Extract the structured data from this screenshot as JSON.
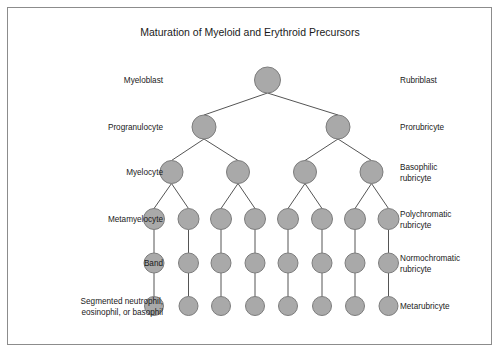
{
  "figure": {
    "title": "Maturation of Myeloid and Erythroid Precursors",
    "frame_color": "#8c8c8c",
    "background_color": "#ffffff",
    "cell_fill_color": "#a9a9a9",
    "cell_stroke_color": "#7d7d7d",
    "connector_color": "#555555",
    "text_color": "#1a1a1a"
  },
  "rows": [
    {
      "id": "row-blast",
      "y": 80,
      "radius": 13,
      "count": 1,
      "x_positions": [
        267.5
      ],
      "left_label": [
        "Myeloblast"
      ],
      "right_label": [
        "Rubriblast"
      ]
    },
    {
      "id": "row-progranulocyte",
      "y": 127,
      "radius": 12,
      "count": 2,
      "x_positions": [
        204,
        338
      ],
      "left_label": [
        "Progranulocyte"
      ],
      "right_label": [
        "Prorubricyte"
      ]
    },
    {
      "id": "row-myelocyte",
      "y": 172,
      "radius": 11.5,
      "count": 4,
      "x_positions": [
        171.5,
        238,
        305,
        371.5
      ],
      "left_label": [
        "Myelocyte"
      ],
      "right_label": [
        "Basophilic",
        "rubricyte"
      ]
    },
    {
      "id": "row-metamyelocyte",
      "y": 219,
      "radius": 10.5,
      "count": 8,
      "x_positions": [
        154,
        188.5,
        221,
        255,
        288,
        322,
        355,
        388.5
      ],
      "left_label": [
        "Metamyelocyte"
      ],
      "right_label": [
        "Polychromatic",
        "rubricyte"
      ]
    },
    {
      "id": "row-band",
      "y": 263,
      "radius": 10,
      "count": 8,
      "x_positions": [
        154,
        188.5,
        221,
        255,
        288,
        322,
        355,
        388.5
      ],
      "left_label": [
        "Band"
      ],
      "right_label": [
        "Normochromatic",
        "rubricyte"
      ]
    },
    {
      "id": "row-segmented",
      "y": 306,
      "radius": 9.5,
      "count": 8,
      "x_positions": [
        154,
        188.5,
        221,
        255,
        288,
        322,
        355,
        388.5
      ],
      "left_label": [
        "Segmented neutrophil,",
        "eosinophil, or basophil"
      ],
      "right_label": [
        "Metarubricyte"
      ]
    }
  ],
  "layout": {
    "left_label_x": 163,
    "right_label_x": 400,
    "title_x": 250,
    "title_y": 36,
    "line_height": 11
  },
  "edges": [
    {
      "from_row": 0,
      "from_index": 0,
      "to_row": 1,
      "to_index": 0
    },
    {
      "from_row": 0,
      "from_index": 0,
      "to_row": 1,
      "to_index": 1
    },
    {
      "from_row": 1,
      "from_index": 0,
      "to_row": 2,
      "to_index": 0
    },
    {
      "from_row": 1,
      "from_index": 0,
      "to_row": 2,
      "to_index": 1
    },
    {
      "from_row": 1,
      "from_index": 1,
      "to_row": 2,
      "to_index": 2
    },
    {
      "from_row": 1,
      "from_index": 1,
      "to_row": 2,
      "to_index": 3
    },
    {
      "from_row": 2,
      "from_index": 0,
      "to_row": 3,
      "to_index": 0
    },
    {
      "from_row": 2,
      "from_index": 0,
      "to_row": 3,
      "to_index": 1
    },
    {
      "from_row": 2,
      "from_index": 1,
      "to_row": 3,
      "to_index": 2
    },
    {
      "from_row": 2,
      "from_index": 1,
      "to_row": 3,
      "to_index": 3
    },
    {
      "from_row": 2,
      "from_index": 2,
      "to_row": 3,
      "to_index": 4
    },
    {
      "from_row": 2,
      "from_index": 2,
      "to_row": 3,
      "to_index": 5
    },
    {
      "from_row": 2,
      "from_index": 3,
      "to_row": 3,
      "to_index": 6
    },
    {
      "from_row": 2,
      "from_index": 3,
      "to_row": 3,
      "to_index": 7
    },
    {
      "from_row": 3,
      "from_index": 0,
      "to_row": 4,
      "to_index": 0
    },
    {
      "from_row": 3,
      "from_index": 1,
      "to_row": 4,
      "to_index": 1
    },
    {
      "from_row": 3,
      "from_index": 2,
      "to_row": 4,
      "to_index": 2
    },
    {
      "from_row": 3,
      "from_index": 3,
      "to_row": 4,
      "to_index": 3
    },
    {
      "from_row": 3,
      "from_index": 4,
      "to_row": 4,
      "to_index": 4
    },
    {
      "from_row": 3,
      "from_index": 5,
      "to_row": 4,
      "to_index": 5
    },
    {
      "from_row": 3,
      "from_index": 6,
      "to_row": 4,
      "to_index": 6
    },
    {
      "from_row": 3,
      "from_index": 7,
      "to_row": 4,
      "to_index": 7
    },
    {
      "from_row": 4,
      "from_index": 0,
      "to_row": 5,
      "to_index": 0
    },
    {
      "from_row": 4,
      "from_index": 1,
      "to_row": 5,
      "to_index": 1
    },
    {
      "from_row": 4,
      "from_index": 2,
      "to_row": 5,
      "to_index": 2
    },
    {
      "from_row": 4,
      "from_index": 3,
      "to_row": 5,
      "to_index": 3
    },
    {
      "from_row": 4,
      "from_index": 4,
      "to_row": 5,
      "to_index": 4
    },
    {
      "from_row": 4,
      "from_index": 5,
      "to_row": 5,
      "to_index": 5
    },
    {
      "from_row": 4,
      "from_index": 6,
      "to_row": 5,
      "to_index": 6
    },
    {
      "from_row": 4,
      "from_index": 7,
      "to_row": 5,
      "to_index": 7
    }
  ]
}
